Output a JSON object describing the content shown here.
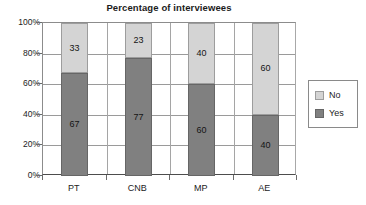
{
  "chart_data": {
    "type": "bar",
    "subtype": "stacked-percentage-column",
    "title": "Percentage of interviewees",
    "xlabel": "",
    "ylabel": "",
    "categories": [
      "PT",
      "CNB",
      "MP",
      "AE"
    ],
    "series": [
      {
        "name": "No",
        "values": [
          33,
          23,
          40,
          60
        ],
        "color": "#d4d4d4"
      },
      {
        "name": "Yes",
        "values": [
          67,
          77,
          60,
          40
        ],
        "color": "#808080"
      }
    ],
    "stack_order_bottom_to_top": [
      "Yes",
      "No"
    ],
    "ylim": [
      0,
      100
    ],
    "ytick_values": [
      0,
      20,
      40,
      60,
      80,
      100
    ],
    "ytick_labels": [
      "0%",
      "20%",
      "40%",
      "60%",
      "80%",
      "100%"
    ],
    "grid": {
      "horizontal": true,
      "vertical": true
    },
    "legend": {
      "position": "right",
      "entries": [
        {
          "label": "No",
          "color": "#d4d4d4"
        },
        {
          "label": "Yes",
          "color": "#808080"
        }
      ]
    },
    "data_labels": {
      "PT": {
        "No": "33",
        "Yes": "67"
      },
      "CNB": {
        "No": "23",
        "Yes": "77"
      },
      "MP": {
        "No": "40",
        "Yes": "60"
      },
      "AE": {
        "No": "60",
        "Yes": "40"
      }
    }
  },
  "colors": {
    "no": "#d4d4d4",
    "yes": "#808080",
    "axis": "#6b6b6b",
    "grid": "#9a9a9a",
    "text": "#1c1c1c",
    "background": "#ffffff"
  }
}
